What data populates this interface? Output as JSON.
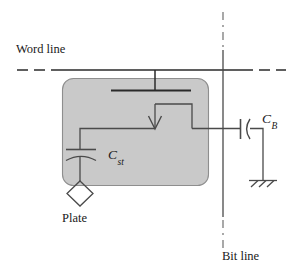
{
  "figure": {
    "type": "circuit-schematic",
    "background_color": "#ffffff",
    "line_color": "#2a2a2a",
    "cell_fill_color": "#c9c9c9",
    "cell_stroke_color": "#8d8d8d"
  },
  "labels": {
    "word_line": "Word line",
    "bit_line": "Bit line",
    "plate": "Plate",
    "storage_capacitor": {
      "base": "C",
      "sub": "st"
    },
    "bit_line_capacitor": {
      "base": "C",
      "sub": "B"
    }
  },
  "nodes": {
    "word_line_style": "dash-dash-solid-dash-dash horizontal rail",
    "bit_line_style": "dash-dot vertical rail",
    "transistor": "n-channel MOSFET pass gate inside shaded cell region",
    "ground": "earth symbol with three hatch strokes"
  }
}
